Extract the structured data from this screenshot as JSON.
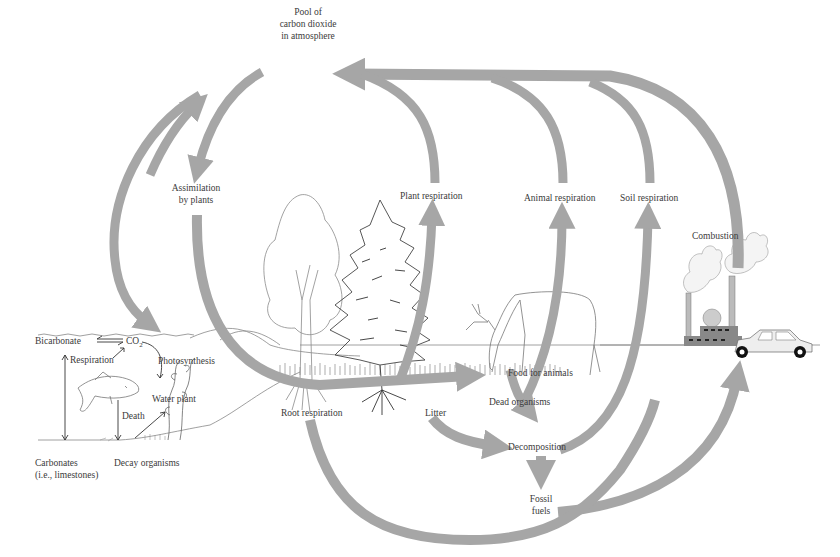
{
  "colors": {
    "arrow": "#a6a6a6",
    "line": "#555555",
    "ground": "#9a9a9a",
    "factory": "#8a8a8a",
    "text": "#3a3a3a"
  },
  "nodes": {
    "atmosphere_pool": [
      "Pool of",
      "carbon dioxide",
      "in atmosphere"
    ],
    "assimilation": [
      "Assimilation",
      "by plants"
    ],
    "plant_respiration": "Plant respiration",
    "animal_respiration": "Animal respiration",
    "soil_respiration": "Soil respiration",
    "combustion": "Combustion",
    "food_for_animals": "Food for animals",
    "root_respiration": "Root respiration",
    "litter": "Litter",
    "dead_organisms": "Dead organisms",
    "decomposition": "Decomposition",
    "fossil_fuels": [
      "Fossil",
      "fuels"
    ]
  },
  "aquatic": {
    "bicarbonate": "Bicarbonate",
    "co2": "CO",
    "co2_subscript": "2",
    "respiration": "Respiration",
    "photosynthesis": "Photosynthesis",
    "water_plant": "Water plant",
    "death": "Death",
    "decay_organisms": "Decay organisms",
    "carbonates": [
      "Carbonates",
      "(i.e., limestones)"
    ]
  },
  "illustrations": [
    "deciduous-tree",
    "conifer-tree",
    "deer",
    "fish",
    "water-plant",
    "factory",
    "car",
    "smoke-clouds"
  ]
}
